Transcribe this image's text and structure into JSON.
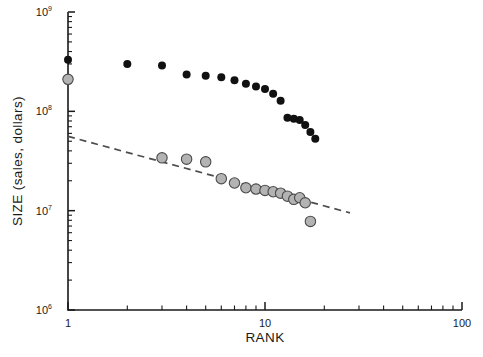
{
  "chart_data": {
    "type": "scatter",
    "title": "",
    "xlabel": "RANK",
    "ylabel": "SIZE (sales, dollars)",
    "xscale": "log",
    "yscale": "log",
    "xlim": [
      1,
      100
    ],
    "ylim": [
      1000000,
      1000000000
    ],
    "grid": false,
    "legend": "none",
    "x_tick_labels": [
      "1",
      "10",
      "100"
    ],
    "x_tick_values": [
      1,
      10,
      100
    ],
    "y_tick_labels": [
      "10⁶",
      "10⁷",
      "10⁸",
      "10⁹"
    ],
    "y_tick_bases": [
      "10",
      "10",
      "10",
      "10"
    ],
    "y_tick_exponents": [
      "6",
      "7",
      "8",
      "9"
    ],
    "y_tick_values": [
      1000000,
      10000000,
      100000000,
      1000000000
    ],
    "series": [
      {
        "name": "upper-series-black",
        "marker": "filled-circle",
        "color": "#111111",
        "points": [
          {
            "rank": 1,
            "size": 330000000
          },
          {
            "rank": 2,
            "size": 300000000
          },
          {
            "rank": 3,
            "size": 290000000
          },
          {
            "rank": 4,
            "size": 235000000
          },
          {
            "rank": 5,
            "size": 228000000
          },
          {
            "rank": 6,
            "size": 220000000
          },
          {
            "rank": 7,
            "size": 205000000
          },
          {
            "rank": 8,
            "size": 190000000
          },
          {
            "rank": 9,
            "size": 178000000
          },
          {
            "rank": 10,
            "size": 168000000
          },
          {
            "rank": 11,
            "size": 150000000
          },
          {
            "rank": 12,
            "size": 128000000
          },
          {
            "rank": 13,
            "size": 86000000
          },
          {
            "rank": 14,
            "size": 84000000
          },
          {
            "rank": 15,
            "size": 82000000
          },
          {
            "rank": 16,
            "size": 73000000
          },
          {
            "rank": 17,
            "size": 62000000
          },
          {
            "rank": 18,
            "size": 53000000
          }
        ]
      },
      {
        "name": "lower-series-gray",
        "marker": "open-circle",
        "color": "#b3b3b3",
        "edge_color": "#4a4a4a",
        "points": [
          {
            "rank": 1,
            "size": 210000000
          },
          {
            "rank": 3,
            "size": 34000000
          },
          {
            "rank": 4,
            "size": 33000000
          },
          {
            "rank": 5,
            "size": 31000000
          },
          {
            "rank": 6,
            "size": 21000000
          },
          {
            "rank": 7,
            "size": 19000000
          },
          {
            "rank": 8,
            "size": 17000000
          },
          {
            "rank": 9,
            "size": 16500000
          },
          {
            "rank": 10,
            "size": 16000000
          },
          {
            "rank": 11,
            "size": 15500000
          },
          {
            "rank": 12,
            "size": 15000000
          },
          {
            "rank": 13,
            "size": 14000000
          },
          {
            "rank": 14,
            "size": 13000000
          },
          {
            "rank": 15,
            "size": 13500000
          },
          {
            "rank": 16,
            "size": 12000000
          },
          {
            "rank": 17,
            "size": 7800000
          }
        ]
      }
    ],
    "annotations": [
      {
        "name": "power-law-fit-line",
        "style": "dashed",
        "color": "#4d4d4d",
        "from": {
          "rank": 1,
          "size": 56000000
        },
        "to": {
          "rank": 27,
          "size": 9500000
        }
      }
    ]
  }
}
